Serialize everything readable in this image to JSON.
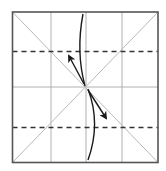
{
  "diagram": {
    "type": "origami-fold-diagram",
    "colors": {
      "background": "#ffffff",
      "frame": "#555555",
      "grid": "#b0b0b0",
      "diagonal": "#b8b8b8",
      "valley_fold": "#333333",
      "arrow": "#1a1a1a"
    },
    "square": {
      "x1": 12.5,
      "y1": 12,
      "x2": 158,
      "y2": 162.5
    },
    "grid_lines": {
      "vertical_x": [
        51,
        86,
        122
      ],
      "horizontal_y": [
        87
      ]
    },
    "diagonals": [
      {
        "from": [
          12.5,
          12
        ],
        "to": [
          158,
          162.5
        ]
      },
      {
        "from": [
          158,
          12
        ],
        "to": [
          12.5,
          162.5
        ]
      }
    ],
    "valley_folds": [
      {
        "name": "upper-valley-fold",
        "y": 51.5
      },
      {
        "name": "lower-valley-fold",
        "y": 127.5
      }
    ],
    "arrows": [
      {
        "name": "upper-fold-arrow",
        "curve": "M83,14 C79,35 78,60 85,86",
        "pointer_from": [
          84,
          84
        ],
        "pointer_to": [
          69,
          56
        ]
      },
      {
        "name": "lower-fold-arrow",
        "curve": "M88,89 C96,110 97,135 88,160",
        "pointer_from": [
          88,
          90
        ],
        "pointer_to": [
          106,
          118
        ]
      }
    ]
  }
}
